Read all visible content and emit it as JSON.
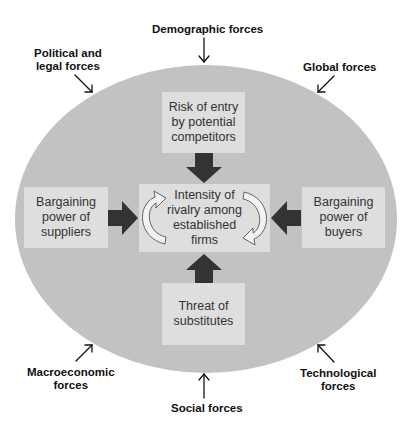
{
  "external_forces": {
    "demographic": "Demographic forces",
    "political_1": "Political and",
    "political_2": "legal forces",
    "global": "Global forces",
    "macroeconomic_1": "Macroeconomic",
    "macroeconomic_2": "forces",
    "technological_1": "Technological",
    "technological_2": "forces",
    "social": "Social forces"
  },
  "five_forces": {
    "entry": [
      "Risk of entry",
      "by potential",
      "competitors"
    ],
    "suppliers": [
      "Bargaining",
      "power of",
      "suppliers"
    ],
    "rivalry": [
      "Intensity of",
      "rivalry among",
      "established",
      "firms"
    ],
    "buyers": [
      "Bargaining",
      "power of",
      "buyers"
    ],
    "substitutes": [
      "Threat of",
      "substitutes"
    ]
  },
  "colors": {
    "ellipse": "#c2c2c2",
    "box": "#dedede",
    "arrow": "#333333",
    "text": "#111111"
  }
}
